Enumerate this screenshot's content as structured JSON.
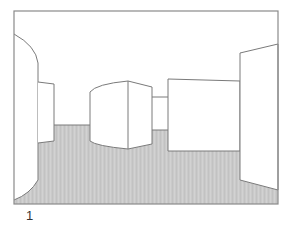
{
  "figure": {
    "label": "1",
    "colors": {
      "frame": "#8a8a8a",
      "line": "#7a7a7a",
      "floor": "#c9c9c9",
      "wall": "#ffffff"
    }
  }
}
